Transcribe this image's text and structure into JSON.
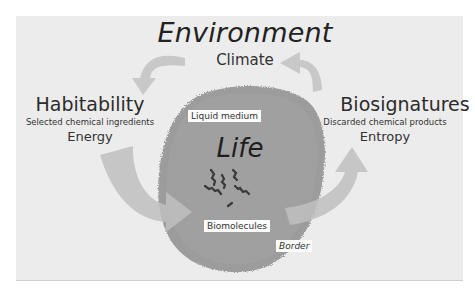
{
  "diagram": {
    "title": "Environment",
    "environment_sub": "Climate",
    "center": {
      "title": "Life",
      "labels": {
        "medium": "Liquid medium",
        "molecules": "Biomolecules",
        "border": "Border"
      }
    },
    "left": {
      "title": "Habitability",
      "subtitle": "Selected chemical ingredients",
      "detail": "Energy"
    },
    "right": {
      "title": "Biosignatures",
      "subtitle": "Discarded chemical products",
      "detail": "Entropy"
    },
    "flows": [
      {
        "from": "Environment",
        "to": "Habitability"
      },
      {
        "from": "Habitability",
        "to": "Life"
      },
      {
        "from": "Life",
        "to": "Biosignatures"
      },
      {
        "from": "Biosignatures",
        "to": "Environment"
      }
    ],
    "colors": {
      "background": "#ececec",
      "cell": "#9c9c9c",
      "arrow": "#c4c4c4",
      "text": "#2a2a2a"
    }
  }
}
